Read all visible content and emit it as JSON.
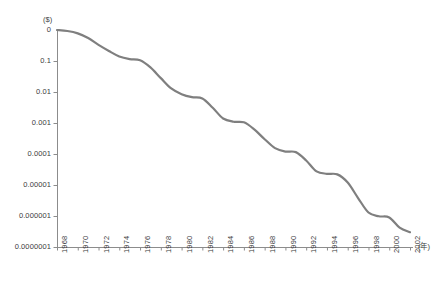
{
  "chart_data": {
    "type": "line",
    "title": "",
    "subtitle": "",
    "xlabel": "(年)",
    "ylabel": "($)",
    "ylabel_unit_text": "($)",
    "xlabel_unit_text": "(年)",
    "yscale": "log",
    "xscale": "linear",
    "grid": false,
    "legend": null,
    "legend_position": "none",
    "xlim": [
      1968,
      2002
    ],
    "ylim": [
      1e-07,
      1
    ],
    "ytick_labels": [
      "0",
      "0.1",
      "0.01",
      "0.001",
      "0.0001",
      "0.00001",
      "0.000001",
      "0.0000001"
    ],
    "ytick_values": [
      1,
      0.1,
      0.01,
      0.001,
      0.0001,
      1e-05,
      1e-06,
      1e-07
    ],
    "xtick_labels": [
      "1968",
      "1970",
      "1972",
      "1974",
      "1976",
      "1978",
      "1980",
      "1982",
      "1984",
      "1986",
      "1988",
      "1990",
      "1992",
      "1994",
      "1996",
      "1998",
      "2000",
      "2002"
    ],
    "xtick_values": [
      1968,
      1970,
      1972,
      1974,
      1976,
      1978,
      1980,
      1982,
      1984,
      1986,
      1988,
      1990,
      1992,
      1994,
      1996,
      1998,
      2000,
      2002
    ],
    "series": [
      {
        "name": "cost",
        "color": "#7f7f7f",
        "x": [
          1968,
          1969,
          1970,
          1971,
          1972,
          1973,
          1974,
          1975,
          1976,
          1977,
          1978,
          1979,
          1980,
          1981,
          1982,
          1983,
          1984,
          1985,
          1986,
          1987,
          1988,
          1989,
          1990,
          1991,
          1992,
          1993,
          1994,
          1995,
          1996,
          1997,
          1998,
          1999,
          2000,
          2001,
          2002
        ],
        "y": [
          1.0,
          0.93,
          0.78,
          0.55,
          0.33,
          0.21,
          0.14,
          0.115,
          0.105,
          0.062,
          0.028,
          0.013,
          0.0085,
          0.0068,
          0.0062,
          0.0031,
          0.0014,
          0.0011,
          0.00105,
          0.00062,
          0.0003,
          0.000155,
          0.00012,
          0.000115,
          6.2e-05,
          2.75e-05,
          2.3e-05,
          2.2e-05,
          1.2e-05,
          3.8e-06,
          1.3e-06,
          9.8e-07,
          9e-07,
          4.2e-07,
          3e-07
        ]
      }
    ]
  },
  "axes_geometry": {
    "plot_left_px": 57,
    "plot_right_px": 410,
    "plot_top_px": 30,
    "plot_bottom_px": 247
  }
}
